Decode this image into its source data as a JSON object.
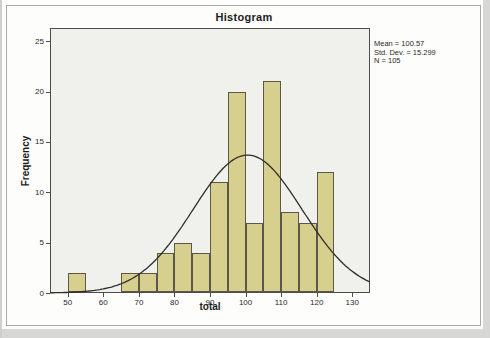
{
  "figure": {
    "title": "Histogram",
    "x_axis_label": "total",
    "y_axis_label": "Frequency",
    "stats_lines": [
      "Mean = 100.57",
      "Std. Dev. = 15.299",
      "N = 105"
    ]
  },
  "chart_data": {
    "type": "bar",
    "subtype": "histogram",
    "title": "Histogram",
    "xlabel": "total",
    "ylabel": "Frequency",
    "xlim": [
      45,
      135
    ],
    "ylim": [
      0,
      26.3
    ],
    "x_ticks": [
      50,
      60,
      70,
      80,
      90,
      100,
      110,
      120,
      130
    ],
    "y_ticks": [
      0,
      5,
      10,
      15,
      20,
      25
    ],
    "bin_width": 5,
    "bins": [
      {
        "x0": 50,
        "x1": 55,
        "count": 2
      },
      {
        "x0": 65,
        "x1": 70,
        "count": 2
      },
      {
        "x0": 70,
        "x1": 75,
        "count": 2
      },
      {
        "x0": 75,
        "x1": 80,
        "count": 4
      },
      {
        "x0": 80,
        "x1": 85,
        "count": 5
      },
      {
        "x0": 85,
        "x1": 90,
        "count": 4
      },
      {
        "x0": 90,
        "x1": 95,
        "count": 11
      },
      {
        "x0": 95,
        "x1": 100,
        "count": 20
      },
      {
        "x0": 100,
        "x1": 105,
        "count": 7
      },
      {
        "x0": 105,
        "x1": 110,
        "count": 21
      },
      {
        "x0": 110,
        "x1": 115,
        "count": 8
      },
      {
        "x0": 115,
        "x1": 120,
        "count": 7
      },
      {
        "x0": 120,
        "x1": 125,
        "count": 12
      }
    ],
    "normal_curve": {
      "mean": 100.57,
      "std_dev": 15.299,
      "n": 105,
      "bin_width": 5
    },
    "annotations": [
      "Mean = 100.57",
      "Std. Dev. = 15.299",
      "N = 105"
    ],
    "grid": false,
    "legend": null,
    "colors": {
      "bar_fill": "#d7cf8e",
      "bar_border": "#5b5847",
      "curve": "#2e2d28",
      "plot_background": "#f0f0ec",
      "axis": "#4c4c4c",
      "figure_frame": "#a9a9a5"
    }
  }
}
